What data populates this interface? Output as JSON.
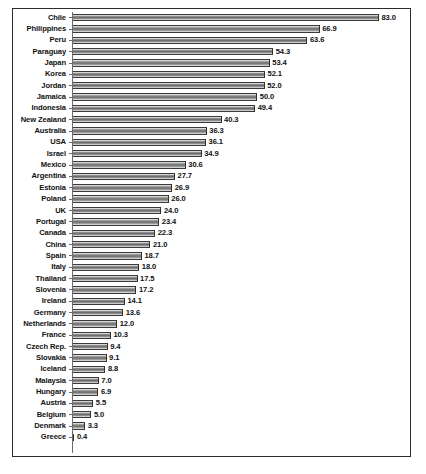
{
  "chart_data": {
    "type": "bar",
    "orientation": "horizontal",
    "title": "",
    "subtitle": "",
    "xlabel": "",
    "ylabel": "",
    "xlim": [
      0,
      83
    ],
    "grid": false,
    "legend": null,
    "value_labels_shown": true,
    "value_label_format": "one-decimal",
    "sorted": "descending",
    "categories": [
      "Chile",
      "Philippines",
      "Peru",
      "Paraguay",
      "Japan",
      "Korea",
      "Jordan",
      "Jamaica",
      "Indonesia",
      "New Zealand",
      "Australia",
      "USA",
      "Israel",
      "Mexico",
      "Argentina",
      "Estonia",
      "Poland",
      "UK",
      "Portugal",
      "Canada",
      "China",
      "Spain",
      "Italy",
      "Thailand",
      "Slovenia",
      "Ireland",
      "Germany",
      "Netherlands",
      "France",
      "Czech Rep.",
      "Slovakia",
      "Iceland",
      "Malaysia",
      "Hungary",
      "Austria",
      "Belgium",
      "Denmark",
      "Greece"
    ],
    "values": [
      83.0,
      66.9,
      63.6,
      54.3,
      53.4,
      52.1,
      52.0,
      50.0,
      49.4,
      40.3,
      36.3,
      36.1,
      34.9,
      30.6,
      27.7,
      26.9,
      26.0,
      24.0,
      23.4,
      22.3,
      21.0,
      18.7,
      18.0,
      17.5,
      17.2,
      14.1,
      13.6,
      12.0,
      10.3,
      9.4,
      9.1,
      8.8,
      7.0,
      6.9,
      5.5,
      5.0,
      3.3,
      0.4
    ],
    "value_text": [
      "83.0",
      "66.9",
      "63.6",
      "54.3",
      "53.4",
      "52.1",
      "52.0",
      "50.0",
      "49.4",
      "40.3",
      "36.3",
      "36.1",
      "34.9",
      "30.6",
      "27.7",
      "26.9",
      "26.0",
      "24.0",
      "23.4",
      "22.3",
      "21.0",
      "18.7",
      "18.0",
      "17.5",
      "17.2",
      "14.1",
      "13.6",
      "12.0",
      "10.3",
      "9.4",
      "9.1",
      "8.8",
      "7.0",
      "6.9",
      "5.5",
      "5.0",
      "3.3",
      "0.4"
    ],
    "colors": {
      "bar_fill_light": "#e9e9e9",
      "bar_fill_dark": "#6e6e6e",
      "bar_outline": "#3a3a3a",
      "frame": "#2b2b2b",
      "text": "#111111",
      "background": "#ffffff"
    }
  },
  "caption": {
    "source_text": ""
  }
}
